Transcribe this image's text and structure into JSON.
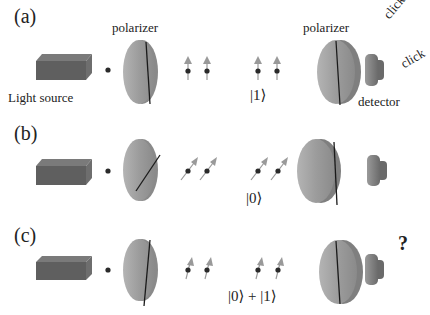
{
  "figure": {
    "colors": {
      "source_top": "#7a7a7a",
      "source_front": "#5f5f5f",
      "source_side": "#6e6e6e",
      "polarizer_face": "#a6a6a6",
      "polarizer_edge": "#8a8a8a",
      "polarizer_axis": "#1a1a1a",
      "detector_front": "#8c8c8c",
      "detector_back": "#6f6f6f",
      "photon_dot": "#2a2a2a",
      "photon_arrow": "#999999"
    },
    "labels": {
      "polarizer_1": "polarizer",
      "polarizer_2": "polarizer",
      "light_source": "Light source",
      "detector": "detector",
      "click_1": "click",
      "click_2": "click",
      "question": "?"
    },
    "panels": [
      {
        "id": "a",
        "label": "(a)",
        "first_polarizer_axis": "vertical",
        "photon_polarization": "vertical",
        "state": "|1⟩",
        "outcome": "click"
      },
      {
        "id": "b",
        "label": "(b)",
        "first_polarizer_axis": "diagonal",
        "photon_polarization": "diagonal",
        "state": "|0⟩",
        "outcome": "none"
      },
      {
        "id": "c",
        "label": "(c)",
        "first_polarizer_axis": "slight-tilt",
        "photon_polarization": "slight-tilt",
        "state": "|0⟩ + |1⟩",
        "outcome": "?"
      }
    ]
  }
}
